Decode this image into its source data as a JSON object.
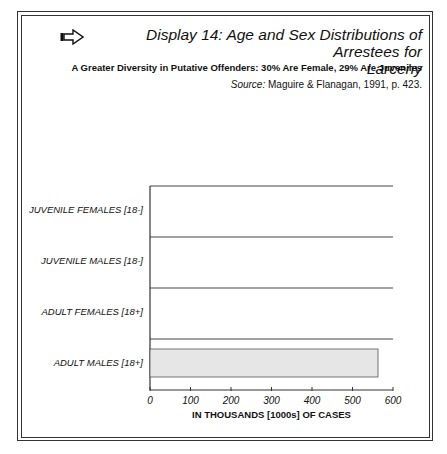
{
  "header": {
    "icon": "right-arrow-icon",
    "title": "Display 14: Age and Sex Distributions of Arrestees for Larceny",
    "title_line1": "Display 14: Age and Sex Distributions of Arrestees for",
    "title_line2": "Larceny",
    "subtitle": "A Greater Diversity in Putative Offenders: 30% Are Female, 29% Are Juveniles",
    "source_label": "Source:",
    "source_text": " Maguire & Flanagan, 1991, p. 423."
  },
  "chart_data": {
    "type": "bar",
    "orientation": "horizontal",
    "style": "pictogram",
    "title": "Display 14: Age and Sex Distributions of Arrestees for Larceny",
    "subtitle": "A Greater Diversity in Putative Offenders: 30% Are Female, 29% Are Juveniles",
    "categories": [
      "JUVENILE FEMALES [18-]",
      "JUVENILE MALES [18-]",
      "ADULT FEMALES [18+]",
      "ADULT MALES [18+]"
    ],
    "values": [
      88,
      240,
      263,
      563
    ],
    "icon_types": [
      "female",
      "male",
      "female",
      "male"
    ],
    "units_per_icon": 40,
    "xlabel": "IN THOUSANDS [1000s] OF CASES",
    "ylabel": "",
    "xlim": [
      0,
      600
    ],
    "xticks": [
      0,
      100,
      200,
      300,
      400,
      500,
      600
    ],
    "grid": false,
    "legend": null,
    "source": "Maguire & Flanagan, 1991, p. 423."
  }
}
